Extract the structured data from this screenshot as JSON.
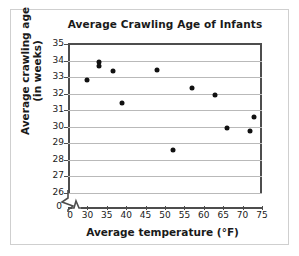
{
  "chart_data": {
    "type": "scatter",
    "title": "Average Crawling Age of Infants",
    "xlabel": "Average temperature (°F)",
    "ylabel_line1": "Average crawling age",
    "ylabel_line2": "(in weeks)",
    "xlim": [
      25,
      75
    ],
    "ylim": [
      26,
      35
    ],
    "xticks": [
      0,
      30,
      35,
      40,
      45,
      50,
      55,
      60,
      65,
      70,
      75
    ],
    "yticks": [
      35,
      34,
      33,
      32,
      31,
      30,
      29,
      28,
      27,
      26
    ],
    "y_zero_tick": "0",
    "x_axis_break": true,
    "y_axis_break": true,
    "grid": "horizontal",
    "legend": "none",
    "marker_color": "#111111",
    "points": [
      {
        "x": 30,
        "y": 32.8
      },
      {
        "x": 33,
        "y": 33.9
      },
      {
        "x": 33,
        "y": 33.65
      },
      {
        "x": 36.5,
        "y": 33.35
      },
      {
        "x": 39,
        "y": 31.45
      },
      {
        "x": 48,
        "y": 33.4
      },
      {
        "x": 52,
        "y": 28.6
      },
      {
        "x": 57,
        "y": 32.35
      },
      {
        "x": 63,
        "y": 31.9
      },
      {
        "x": 66,
        "y": 29.9
      },
      {
        "x": 72,
        "y": 29.75
      },
      {
        "x": 73,
        "y": 30.6
      }
    ]
  }
}
